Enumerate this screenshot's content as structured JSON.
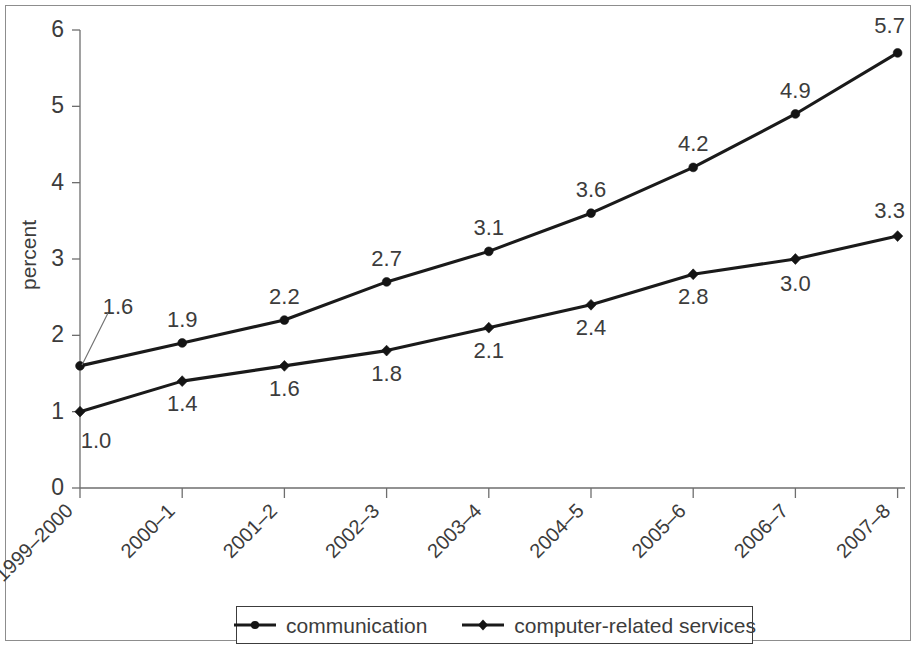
{
  "chart_data": {
    "type": "line",
    "title": "",
    "subtitle": "",
    "xlabel": "",
    "ylabel": "percent",
    "ylim": [
      0,
      6
    ],
    "yticks": [
      0,
      1,
      2,
      3,
      4,
      5,
      6
    ],
    "ytick_labels": [
      "0",
      "1",
      "2",
      "3",
      "4",
      "5",
      "6"
    ],
    "grid": false,
    "legend_position": "bottom",
    "categories": [
      "1999–2000",
      "2000–1",
      "2001–2",
      "2002–3",
      "2003–4",
      "2004–5",
      "2005–6",
      "2006–7",
      "2007–8"
    ],
    "series": [
      {
        "name": "communication",
        "marker": "circle",
        "color": "#1a1a1a",
        "values": [
          1.6,
          1.9,
          2.2,
          2.7,
          3.1,
          3.6,
          4.2,
          4.9,
          5.7
        ],
        "value_labels": [
          "1.6",
          "1.9",
          "2.2",
          "2.7",
          "3.1",
          "3.6",
          "4.2",
          "4.9",
          "5.7"
        ]
      },
      {
        "name": "computer-related services",
        "marker": "diamond",
        "color": "#1a1a1a",
        "values": [
          1.0,
          1.4,
          1.6,
          1.8,
          2.1,
          2.4,
          2.8,
          3.0,
          3.3
        ],
        "value_labels": [
          "1.0",
          "1.4",
          "1.6",
          "1.8",
          "2.1",
          "2.4",
          "2.8",
          "3.0",
          "3.3"
        ]
      }
    ],
    "annotations": [
      {
        "text": "1.6",
        "note": "leader line from label to first communication point"
      }
    ]
  },
  "legend": {
    "entries": [
      {
        "label": "communication",
        "marker": "circle-marker"
      },
      {
        "label": "computer-related services",
        "marker": "diamond-marker"
      }
    ]
  }
}
